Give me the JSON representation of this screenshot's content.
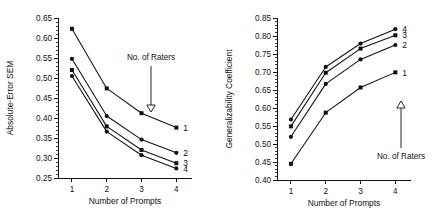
{
  "figure": {
    "panels": [
      "left",
      "right"
    ]
  },
  "chart_data": [
    {
      "type": "line",
      "panel": "left",
      "title": "",
      "xlabel": "Number of Prompts",
      "ylabel": "Absolute-Error SEM",
      "x": [
        1,
        2,
        3,
        4
      ],
      "xticklabels": [
        "1",
        "2",
        "3",
        "4"
      ],
      "xlim": [
        0.6,
        4.45
      ],
      "ylim": [
        0.25,
        0.65
      ],
      "yticks": [
        0.25,
        0.3,
        0.35,
        0.4,
        0.45,
        0.5,
        0.55,
        0.6,
        0.65
      ],
      "yticklabels": [
        "0.25",
        "0.30",
        "0.35",
        "0.40",
        "0.45",
        "0.50",
        "0.55",
        "0.60",
        "0.65"
      ],
      "minor_ticks_per_interval": 4,
      "grid": false,
      "legend_position": "right-of-lines",
      "annotation": {
        "text": "No. of Raters",
        "arrow_direction": "down",
        "arrowhead": "hollow-triangle"
      },
      "series": [
        {
          "name": "1",
          "label": "1",
          "values": [
            0.623,
            0.474,
            0.412,
            0.376
          ],
          "marker": "square"
        },
        {
          "name": "2",
          "label": "2",
          "values": [
            0.548,
            0.405,
            0.346,
            0.313
          ],
          "marker": "circle"
        },
        {
          "name": "3",
          "label": "3",
          "values": [
            0.52,
            0.379,
            0.32,
            0.287
          ],
          "marker": "square"
        },
        {
          "name": "4",
          "label": "4",
          "values": [
            0.505,
            0.366,
            0.307,
            0.274
          ],
          "marker": "circle"
        }
      ]
    },
    {
      "type": "line",
      "panel": "right",
      "title": "",
      "xlabel": "Number of Prompts",
      "ylabel": "Generalizability Coefficient",
      "x": [
        1,
        2,
        3,
        4
      ],
      "xticklabels": [
        "1",
        "2",
        "3",
        "4"
      ],
      "xlim": [
        0.6,
        4.45
      ],
      "ylim": [
        0.4,
        0.85
      ],
      "yticks": [
        0.4,
        0.45,
        0.5,
        0.55,
        0.6,
        0.65,
        0.7,
        0.75,
        0.8,
        0.85
      ],
      "yticklabels": [
        "0.40",
        "0.45",
        "0.50",
        "0.55",
        "0.60",
        "0.65",
        "0.70",
        "0.75",
        "0.80",
        "0.85"
      ],
      "minor_ticks_per_interval": 4,
      "grid": false,
      "legend_position": "right-of-lines",
      "annotation": {
        "text": "No. of Raters",
        "arrow_direction": "up",
        "arrowhead": "hollow-triangle"
      },
      "series": [
        {
          "name": "1",
          "label": "1",
          "values": [
            0.445,
            0.587,
            0.657,
            0.699
          ],
          "marker": "square"
        },
        {
          "name": "2",
          "label": "2",
          "values": [
            0.52,
            0.667,
            0.735,
            0.775
          ],
          "marker": "circle"
        },
        {
          "name": "3",
          "label": "3",
          "values": [
            0.549,
            0.698,
            0.765,
            0.802
          ],
          "marker": "square"
        },
        {
          "name": "4",
          "label": "4",
          "values": [
            0.568,
            0.714,
            0.779,
            0.819
          ],
          "marker": "circle"
        }
      ]
    }
  ]
}
